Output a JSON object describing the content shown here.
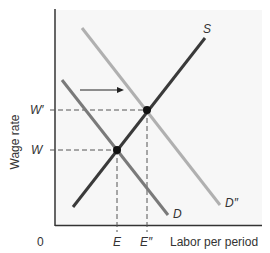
{
  "diagram": {
    "y_axis_label": "Wage rate",
    "x_axis_label": "Labor per period",
    "origin_label": "0",
    "wage_ticks": [
      {
        "label": "W′",
        "y": 110
      },
      {
        "label": "W",
        "y": 150
      }
    ],
    "employment_ticks": [
      {
        "label": "E",
        "x": 117
      },
      {
        "label": "E″",
        "x": 147
      }
    ],
    "curves": {
      "supply": {
        "label": "S",
        "color": "#3a3a3a"
      },
      "demand": {
        "label": "D",
        "color": "#7a7a7a"
      },
      "demand_new": {
        "label": "D″",
        "color": "#b0b0b0"
      }
    },
    "shift_arrow": "demand shifts right"
  }
}
